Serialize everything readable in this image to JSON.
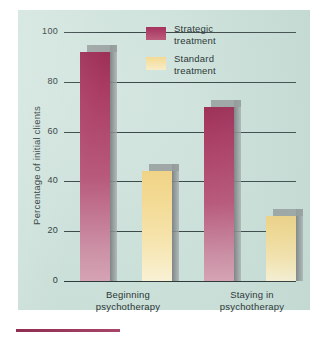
{
  "chart_data": {
    "type": "bar",
    "title": "",
    "subtitle": "",
    "xlabel": "",
    "ylabel": "Percentage of initial clients",
    "ylim": [
      0,
      100
    ],
    "yticks": [
      0,
      20,
      40,
      60,
      80,
      100
    ],
    "ytick_labels": [
      "0",
      "20",
      "40",
      "60",
      "80",
      "100"
    ],
    "grid": true,
    "legend_position": "top-center",
    "categories": [
      "Beginning psychotherapy",
      "Staying in psychotherapy"
    ],
    "category_lines": [
      [
        "Beginning",
        "psychotherapy"
      ],
      [
        "Staying in",
        "psychotherapy"
      ]
    ],
    "series": [
      {
        "name": "Strategic treatment",
        "values": [
          92,
          70
        ],
        "color": "#a83a63"
      },
      {
        "name": "Standard treatment",
        "values": [
          44,
          26
        ],
        "color": "#f3da93"
      }
    ],
    "legend": [
      {
        "label_line1": "Strategic",
        "label_line2": "treatment",
        "swatch": "strategic"
      },
      {
        "label_line1": "Standard",
        "label_line2": "treatment",
        "swatch": "standard"
      }
    ],
    "colors": {
      "panel_background": "#cfe2dc",
      "axis": "#2f3b3b",
      "text": "#2b3636",
      "strategic": "#a83a63",
      "standard": "#f3da93",
      "bar_shadow": "#969d9d",
      "bottom_rule": "#8f2e50"
    }
  }
}
